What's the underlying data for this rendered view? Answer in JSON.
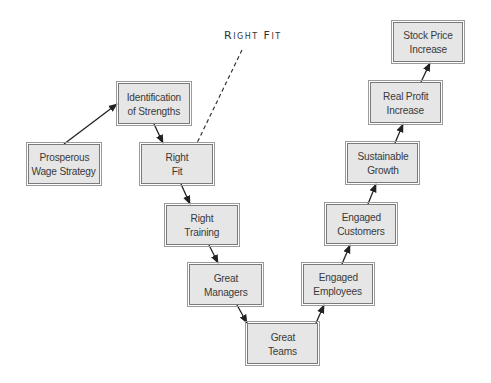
{
  "diagram": {
    "annotation": "Right Fit",
    "colors": {
      "box_fill": "#e6e6e6",
      "box_border": "#7a7a7a",
      "text": "#3a3a3a",
      "arrow": "#222222"
    },
    "nodes": [
      {
        "id": "prosperous",
        "line1": "Prosperous",
        "line2": "Wage Strategy",
        "x": 28,
        "y": 144,
        "w": 72,
        "h": 40
      },
      {
        "id": "identification",
        "line1": "Identification",
        "line2": "of Strengths",
        "x": 118,
        "y": 83,
        "w": 72,
        "h": 41
      },
      {
        "id": "right-fit",
        "line1": "Right",
        "line2": "Fit",
        "x": 141,
        "y": 144,
        "w": 72,
        "h": 40
      },
      {
        "id": "right-training",
        "line1": "Right",
        "line2": "Training",
        "x": 166,
        "y": 205,
        "w": 72,
        "h": 40
      },
      {
        "id": "great-managers",
        "line1": "Great",
        "line2": "Managers",
        "x": 189,
        "y": 264,
        "w": 73,
        "h": 41
      },
      {
        "id": "great-teams",
        "line1": "Great",
        "line2": "Teams",
        "x": 247,
        "y": 323,
        "w": 71,
        "h": 41
      },
      {
        "id": "engaged-employees",
        "line1": "Engaged",
        "line2": "Employees",
        "x": 303,
        "y": 264,
        "w": 70,
        "h": 40
      },
      {
        "id": "engaged-customers",
        "line1": "Engaged",
        "line2": "Customers",
        "x": 326,
        "y": 204,
        "w": 70,
        "h": 40
      },
      {
        "id": "sustainable-growth",
        "line1": "Sustainable",
        "line2": "Growth",
        "x": 347,
        "y": 143,
        "w": 71,
        "h": 40
      },
      {
        "id": "real-profit",
        "line1": "Real Profit",
        "line2": "Increase",
        "x": 370,
        "y": 82,
        "w": 71,
        "h": 41
      },
      {
        "id": "stock-price",
        "line1": "Stock Price",
        "line2": "Increase",
        "x": 393,
        "y": 22,
        "w": 70,
        "h": 40
      }
    ],
    "edges": [
      {
        "from": "Prosperous Wage Strategy",
        "to": "Identification of Strengths"
      },
      {
        "from": "Identification of Strengths",
        "to": "Right Fit"
      },
      {
        "from": "Right Fit",
        "to": "Right Training"
      },
      {
        "from": "Right Training",
        "to": "Great Managers"
      },
      {
        "from": "Great Managers",
        "to": "Great Teams"
      },
      {
        "from": "Great Teams",
        "to": "Engaged Employees"
      },
      {
        "from": "Engaged Employees",
        "to": "Engaged Customers"
      },
      {
        "from": "Engaged Customers",
        "to": "Sustainable Growth"
      },
      {
        "from": "Sustainable Growth",
        "to": "Real Profit Increase"
      },
      {
        "from": "Real Profit Increase",
        "to": "Stock Price Increase"
      }
    ]
  }
}
